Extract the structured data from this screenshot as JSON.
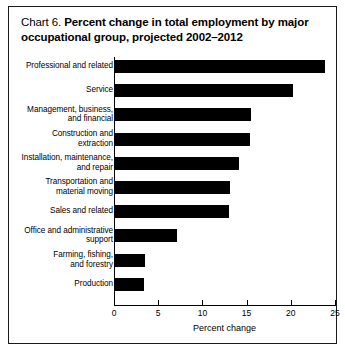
{
  "chart_data": {
    "type": "bar",
    "orientation": "horizontal",
    "title_prefix": "Chart 6.",
    "title": "Percent change in total employment by major occupational group, projected 2002–2012",
    "xlabel": "Percent change",
    "ylabel": "",
    "xlim": [
      0,
      25
    ],
    "xticks": [
      0,
      5,
      10,
      15,
      20,
      25
    ],
    "xtick_labels": [
      "0",
      "5",
      "10",
      "15",
      "20",
      "25"
    ],
    "grid": false,
    "legend": false,
    "bar_color": "#000000",
    "categories": [
      "Professional and related",
      "Service",
      "Management, business, and financial",
      "Construction and extraction",
      "Installation, maintenance, and repair",
      "Transportation and material moving",
      "Sales and related",
      "Office and administrative support",
      "Farming, fishing, and forestry",
      "Production"
    ],
    "category_lines": [
      [
        "Professional and related"
      ],
      [
        "Service"
      ],
      [
        "Management, business,",
        "and financial"
      ],
      [
        "Construction and",
        "extraction"
      ],
      [
        "Installation, maintenance,",
        "and repair"
      ],
      [
        "Transportation and",
        "material moving"
      ],
      [
        "Sales and related"
      ],
      [
        "Office and administrative",
        "support"
      ],
      [
        "Farming, fishing,",
        "and forestry"
      ],
      [
        "Production"
      ]
    ],
    "values": [
      23.7,
      20.1,
      15.4,
      15.3,
      14.0,
      13.0,
      12.9,
      7.0,
      3.4,
      3.3
    ]
  }
}
